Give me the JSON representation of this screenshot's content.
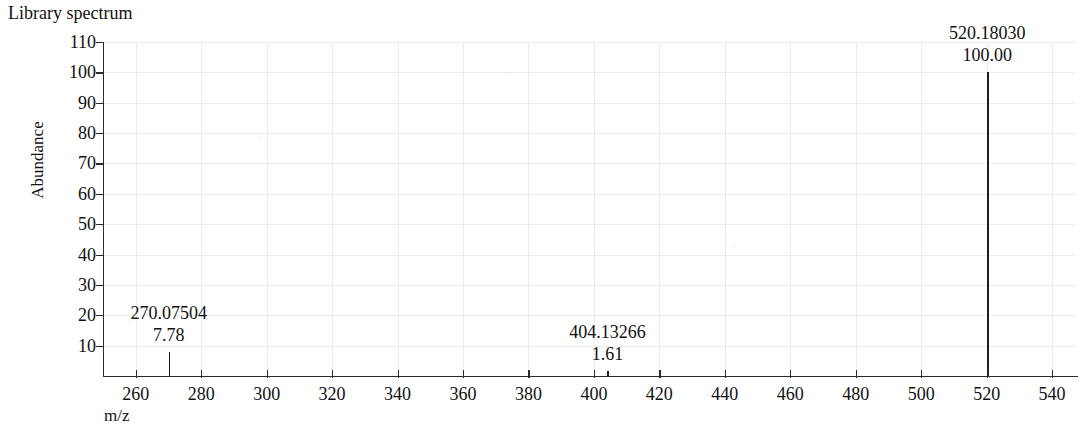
{
  "chart_data": {
    "type": "bar",
    "title": "Library spectrum",
    "xlabel": "m/z",
    "ylabel": "Abundance",
    "xlim": [
      250,
      547
    ],
    "ylim": [
      0,
      110
    ],
    "grid": true,
    "legend": "none",
    "x_ticks": [
      260,
      280,
      300,
      320,
      340,
      360,
      380,
      400,
      420,
      440,
      460,
      480,
      500,
      520,
      540
    ],
    "y_ticks": [
      10,
      20,
      30,
      40,
      50,
      60,
      70,
      80,
      90,
      100,
      110
    ],
    "x": [
      270.07504,
      404.13266,
      520.1803
    ],
    "values": [
      7.78,
      1.61,
      100.0
    ],
    "peaks": [
      {
        "mz": "270.07504",
        "abundance": "7.78",
        "mz_value": 270.07504,
        "abundance_value": 7.78
      },
      {
        "mz": "404.13266",
        "abundance": "1.61",
        "mz_value": 404.13266,
        "abundance_value": 1.61
      },
      {
        "mz": "520.18030",
        "abundance": "100.00",
        "mz_value": 520.1803,
        "abundance_value": 100.0
      }
    ],
    "colors": {
      "peak": "#1f1f1f",
      "axis": "#2b2b2b",
      "grid": "#ececf0",
      "text": "#111111",
      "background": "#ffffff"
    }
  }
}
